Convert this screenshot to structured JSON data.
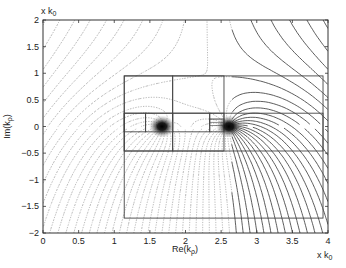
{
  "chart_data": {
    "type": "contour",
    "title": "",
    "xlabel": "Re(k_ρ)",
    "ylabel": "Im(k_ρ)",
    "x_unit_label": "x k_0",
    "y_unit_label": "x k_0",
    "xlim": [
      0,
      4
    ],
    "ylim": [
      -2,
      2
    ],
    "xticks": [
      0,
      0.5,
      1,
      1.5,
      2,
      2.5,
      3,
      3.5,
      4
    ],
    "xtick_labels": [
      "0",
      "0.5",
      "1",
      "1.5",
      "2",
      "2.5",
      "3",
      "3.5",
      "4"
    ],
    "yticks": [
      2,
      1.5,
      1,
      0.5,
      0,
      -0.5,
      -1,
      -1.5,
      -2
    ],
    "ytick_labels": [
      "2",
      "1.5",
      "1",
      "0.5",
      "0",
      "−0.5",
      "−1",
      "−1.5",
      "−2"
    ],
    "grid": false,
    "legend": null,
    "singularities": [
      {
        "name": "pole-1",
        "x": 1.67,
        "y": 0.0
      },
      {
        "name": "pole-2",
        "x": 2.61,
        "y": 0.0
      }
    ],
    "subdivision_rectangles": [
      {
        "x0": 1.14,
        "x1": 3.93,
        "y0": -1.72,
        "y1": 0.95
      },
      {
        "x0": 1.14,
        "x1": 1.82,
        "y0": -0.46,
        "y1": 0.95
      },
      {
        "x0": 1.82,
        "x1": 2.54,
        "y0": -0.46,
        "y1": 0.95
      },
      {
        "x0": 1.14,
        "x1": 3.93,
        "y0": -0.46,
        "y1": 0.25
      },
      {
        "x0": 1.14,
        "x1": 1.44,
        "y0": -0.1,
        "y1": 0.25
      },
      {
        "x0": 1.44,
        "x1": 1.82,
        "y0": -0.1,
        "y1": 0.25
      },
      {
        "x0": 1.82,
        "x1": 2.34,
        "y0": -0.1,
        "y1": 0.25
      },
      {
        "x0": 2.34,
        "x1": 2.54,
        "y0": -0.1,
        "y1": 0.25
      },
      {
        "x0": 2.34,
        "x1": 2.54,
        "y0": 0.02,
        "y1": 0.14
      },
      {
        "x0": 2.34,
        "x1": 2.54,
        "y0": 0.08,
        "y1": 0.14
      }
    ]
  }
}
